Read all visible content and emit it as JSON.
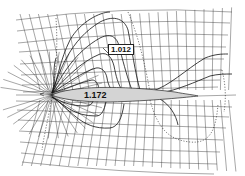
{
  "diagram": {
    "colors": {
      "lines": "#222222",
      "airfoil_fill": "#d4d4d4",
      "background": "#ffffff"
    },
    "labels": {
      "upper_contour": "1.012",
      "airfoil_surface": "1.172"
    }
  }
}
